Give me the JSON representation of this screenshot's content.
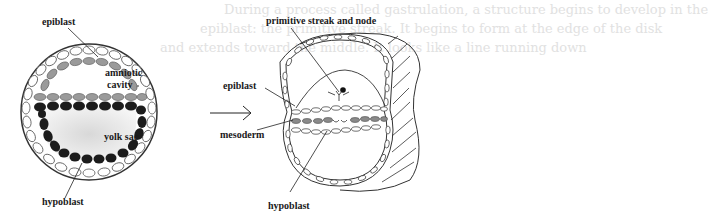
{
  "background_text": {
    "line1": "During a process called gastrulation, a structure begins to develop in the",
    "line2": "epiblast: the primitive streak. It begins to form at the edge of the disk",
    "line3": "and extends toward the middle. It looks like a line running down"
  },
  "left_diagram": {
    "labels": {
      "epiblast": "epiblast",
      "amniotic_cavity_1": "amniotic",
      "amniotic_cavity_2": "cavity",
      "yolk_sac": "yolk sac",
      "hypoblast": "hypoblast"
    },
    "colors": {
      "epiblast_cells": "#9a9a9a",
      "hypoblast_cells": "#1c1c1c",
      "trophoblast_cells": "#ffffff",
      "outline": "#333333"
    }
  },
  "transition_arrow": {
    "direction": "right"
  },
  "right_diagram": {
    "labels": {
      "primitive_streak": "primitive streak and node",
      "epiblast": "epiblast",
      "mesoderm": "mesoderm",
      "hypoblast": "hypoblast"
    }
  }
}
